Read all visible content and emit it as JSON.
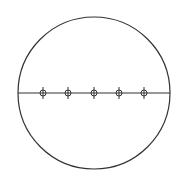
{
  "diagram": {
    "colors": {
      "stroke": "#333333",
      "background": "#ffffff"
    },
    "outer_circle": {
      "cx": 94,
      "cy": 93,
      "r": 76
    },
    "diameter": {
      "x1": 18,
      "x2": 170,
      "y": 93
    },
    "markers": [
      {
        "cx": 43,
        "cy": 93
      },
      {
        "cx": 68,
        "cy": 93
      },
      {
        "cx": 94,
        "cy": 93
      },
      {
        "cx": 119,
        "cy": 93
      },
      {
        "cx": 144,
        "cy": 93
      }
    ],
    "marker_radius": 3,
    "marker_tick_half_length": 6
  }
}
